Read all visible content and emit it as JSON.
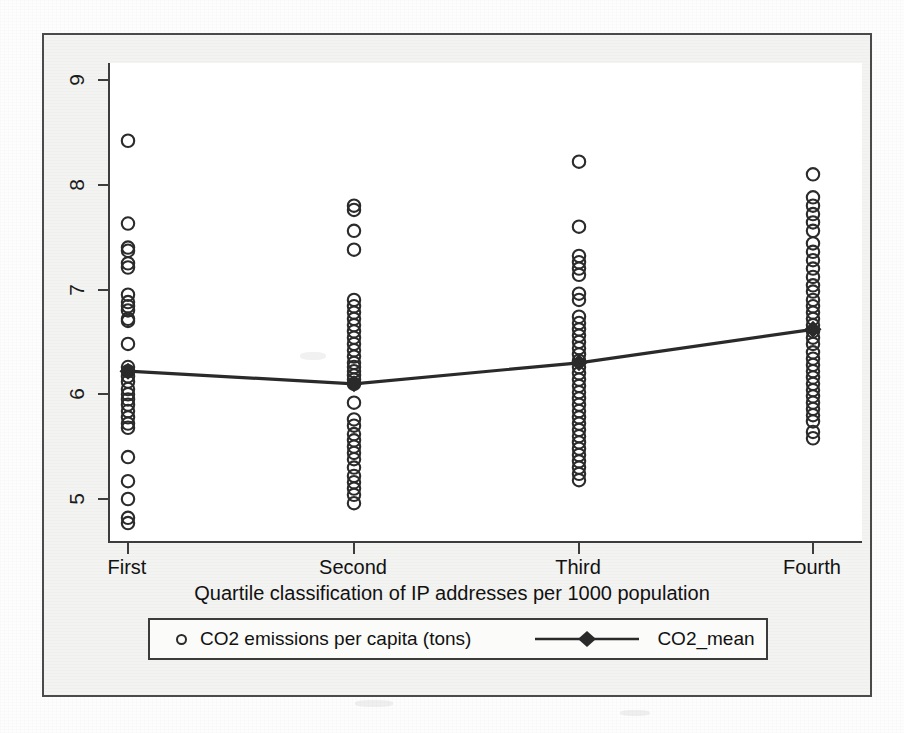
{
  "figure": {
    "kind": "scatter-with-mean-line",
    "frame_color": "#4a4a4a",
    "plot_background": "#ffffff",
    "page_background": "#f3f3f1"
  },
  "axis": {
    "x_title": "Quartile classification of IP addresses per 1000 population",
    "x_tick_labels": [
      "First",
      "Second",
      "Third",
      "Fourth"
    ],
    "y_tick_labels": [
      "5",
      "6",
      "7",
      "8",
      "9"
    ]
  },
  "legend": {
    "points_label": "CO2 emissions per capita (tons)",
    "mean_label": "CO2_mean",
    "points_marker": "open-circle",
    "mean_marker": "filled-diamond-with-line"
  },
  "chart_data": {
    "type": "scatter",
    "title": "",
    "subtitle": "",
    "xlabel": "Quartile classification of IP addresses per 1000 population",
    "ylabel": "",
    "xlim": [
      0.5,
      4.5
    ],
    "ylim": [
      4.6,
      9.3
    ],
    "x_categories": [
      "First",
      "Second",
      "Third",
      "Fourth"
    ],
    "y_ticks": [
      5,
      6,
      7,
      8,
      9
    ],
    "grid": false,
    "legend_position": "below-axis",
    "series": [
      {
        "name": "CO2 emissions per capita (tons)",
        "marker": "open-circle",
        "type": "scatter",
        "points": [
          {
            "category": "First",
            "x": 1,
            "values": [
              8.42,
              7.63,
              7.4,
              7.37,
              7.25,
              7.21,
              6.95,
              6.88,
              6.84,
              6.8,
              6.72,
              6.7,
              6.48,
              6.26,
              6.22,
              6.17,
              6.12,
              6.05,
              6.0,
              5.95,
              5.9,
              5.84,
              5.78,
              5.72,
              5.68,
              5.4,
              5.17,
              5.0,
              4.82,
              4.77
            ]
          },
          {
            "category": "Second",
            "x": 2,
            "values": [
              7.8,
              7.76,
              7.56,
              7.38,
              6.9,
              6.84,
              6.78,
              6.72,
              6.66,
              6.6,
              6.54,
              6.48,
              6.42,
              6.36,
              6.3,
              6.26,
              6.22,
              6.18,
              6.14,
              6.1,
              5.92,
              5.76,
              5.7,
              5.62,
              5.56,
              5.5,
              5.44,
              5.38,
              5.3,
              5.22,
              5.16,
              5.1,
              5.04,
              4.96
            ]
          },
          {
            "category": "Third",
            "x": 3,
            "values": [
              8.22,
              7.6,
              7.32,
              7.26,
              7.2,
              7.14,
              6.96,
              6.9,
              6.74,
              6.68,
              6.62,
              6.56,
              6.5,
              6.44,
              6.38,
              6.32,
              6.26,
              6.2,
              6.14,
              6.08,
              6.02,
              5.96,
              5.9,
              5.84,
              5.78,
              5.72,
              5.66,
              5.6,
              5.54,
              5.48,
              5.42,
              5.36,
              5.3,
              5.24,
              5.18
            ]
          },
          {
            "category": "Fourth",
            "x": 4,
            "values": [
              8.1,
              7.88,
              7.8,
              7.72,
              7.64,
              7.56,
              7.44,
              7.36,
              7.28,
              7.2,
              7.12,
              7.04,
              6.98,
              6.9,
              6.84,
              6.78,
              6.72,
              6.66,
              6.6,
              6.54,
              6.48,
              6.4,
              6.34,
              6.28,
              6.22,
              6.16,
              6.1,
              6.04,
              5.98,
              5.92,
              5.86,
              5.8,
              5.74,
              5.64,
              5.58
            ]
          }
        ]
      },
      {
        "name": "CO2_mean",
        "marker": "filled-diamond",
        "type": "line",
        "categories": [
          "First",
          "Second",
          "Third",
          "Fourth"
        ],
        "values": [
          6.22,
          6.1,
          6.3,
          6.62
        ]
      }
    ]
  }
}
